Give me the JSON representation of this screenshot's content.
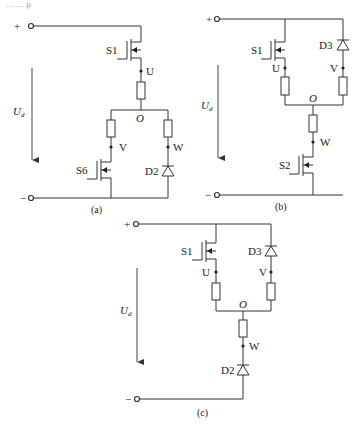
{
  "header_fragment": "…… μ",
  "terminals": {
    "plus": "+",
    "minus": "−"
  },
  "voltage_label": {
    "main": "U",
    "sub": "d"
  },
  "circuits": [
    {
      "id": "a",
      "caption": "(a)",
      "switches": [
        "S1",
        "S6"
      ],
      "diodes": [
        "D2"
      ],
      "nodes": [
        "U",
        "O",
        "V",
        "W"
      ]
    },
    {
      "id": "b",
      "caption": "(b)",
      "switches": [
        "S1",
        "S2"
      ],
      "diodes": [
        "D3"
      ],
      "nodes": [
        "U",
        "V",
        "O",
        "W"
      ]
    },
    {
      "id": "c",
      "caption": "(c)",
      "switches": [
        "S1"
      ],
      "diodes": [
        "D3",
        "D2"
      ],
      "nodes": [
        "U",
        "V",
        "O",
        "W"
      ]
    }
  ],
  "colors": {
    "wire": "#333333",
    "background": "#ffffff"
  }
}
